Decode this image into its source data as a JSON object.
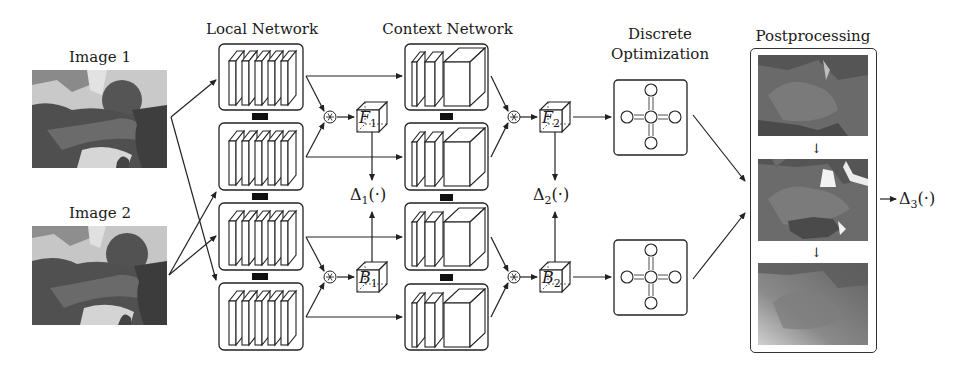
{
  "figure": {
    "inputs": {
      "image1_label": "Image 1",
      "image2_label": "Image 2"
    },
    "sections": {
      "local_network": "Local Network",
      "context_network": "Context Network",
      "discrete_optimization_line1": "Discrete",
      "discrete_optimization_line2": "Optimization",
      "postprocessing": "Postprocessing"
    },
    "operators": {
      "correlation_symbol": "⊛"
    },
    "cost_volumes": {
      "F1": {
        "base": "F",
        "sub": "1"
      },
      "B1": {
        "base": "B",
        "sub": "1"
      },
      "F2": {
        "base": "F",
        "sub": "2"
      },
      "B2": {
        "base": "B",
        "sub": "2"
      }
    },
    "losses": {
      "delta1": {
        "base": "Δ",
        "sub": "1",
        "arg": "(·)"
      },
      "delta2": {
        "base": "Δ",
        "sub": "2",
        "arg": "(·)"
      },
      "delta3": {
        "base": "Δ",
        "sub": "3",
        "arg": "(·)"
      }
    },
    "structure": {
      "local_network_branches": 4,
      "local_network_layers_per_branch": 5,
      "context_network_branches": 4,
      "context_network_layers_per_branch": 3,
      "mrf_graph_nodes": 5,
      "postprocessing_stages": 3
    },
    "colors": {
      "stroke": "#333333",
      "background": "#ffffff",
      "shared_weight_block": "#111111"
    }
  }
}
